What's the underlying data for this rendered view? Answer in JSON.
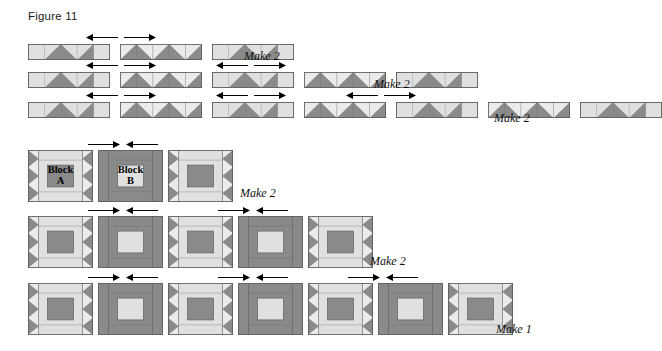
{
  "figure": {
    "title": "Figure 11",
    "title_x": 28,
    "title_y": 10
  },
  "colors": {
    "dark": "#8a8a8a",
    "dark_edge": "#6f6f6f",
    "light": "#e0e0e0",
    "light_alt": "#ebebeb",
    "outline": "#5f5f5f",
    "arrow": "#000000",
    "text": "#111111",
    "background": "#ffffff"
  },
  "legend": {
    "block_a_name": "Block",
    "block_a_sub": "A",
    "block_b_name": "Block",
    "block_b_sub": "B"
  },
  "strip_rows": [
    {
      "id": "strip-row-1",
      "x": 28,
      "y": 44,
      "segment_count": 3,
      "segments": [
        "light",
        "dark",
        "light"
      ],
      "make_label": "Make 2",
      "make_x": 244,
      "make_y": 49,
      "arrows": [
        {
          "dir": "left",
          "x": 86,
          "y": 33
        },
        {
          "dir": "right",
          "x": 124,
          "y": 33
        }
      ]
    },
    {
      "id": "strip-row-2",
      "x": 28,
      "y": 72,
      "segment_count": 5,
      "segments": [
        "light",
        "dark",
        "light",
        "dark",
        "light"
      ],
      "make_label": "Make 2",
      "make_x": 374,
      "make_y": 77,
      "arrows": [
        {
          "dir": "left",
          "x": 86,
          "y": 61
        },
        {
          "dir": "right",
          "x": 124,
          "y": 61
        },
        {
          "dir": "left",
          "x": 216,
          "y": 61
        },
        {
          "dir": "right",
          "x": 254,
          "y": 61
        }
      ]
    },
    {
      "id": "strip-row-3",
      "x": 28,
      "y": 102,
      "segment_count": 7,
      "segments": [
        "light",
        "dark",
        "light",
        "dark",
        "light",
        "dark",
        "light"
      ],
      "make_label": "Make 2",
      "make_x": 494,
      "make_y": 111,
      "arrows": [
        {
          "dir": "left",
          "x": 86,
          "y": 91
        },
        {
          "dir": "right",
          "x": 124,
          "y": 91
        },
        {
          "dir": "left",
          "x": 216,
          "y": 91
        },
        {
          "dir": "right",
          "x": 254,
          "y": 91
        },
        {
          "dir": "left",
          "x": 346,
          "y": 91
        },
        {
          "dir": "right",
          "x": 384,
          "y": 91
        }
      ]
    }
  ],
  "block_rows": [
    {
      "id": "block-row-1",
      "x": 28,
      "y": 150,
      "block_count": 3,
      "blocks": [
        "A",
        "B",
        "A"
      ],
      "labelled": true,
      "make_label": "Make 2",
      "make_x": 240,
      "make_y": 186,
      "arrows": [
        {
          "dir": "right",
          "x": 88,
          "y": 140
        },
        {
          "dir": "left",
          "x": 126,
          "y": 140
        }
      ]
    },
    {
      "id": "block-row-2",
      "x": 28,
      "y": 216,
      "block_count": 5,
      "blocks": [
        "A",
        "B",
        "A",
        "B",
        "A"
      ],
      "labelled": false,
      "make_label": "Make 2",
      "make_x": 370,
      "make_y": 254,
      "arrows": [
        {
          "dir": "right",
          "x": 88,
          "y": 206
        },
        {
          "dir": "left",
          "x": 126,
          "y": 206
        },
        {
          "dir": "right",
          "x": 218,
          "y": 206
        },
        {
          "dir": "left",
          "x": 256,
          "y": 206
        }
      ]
    },
    {
      "id": "block-row-3",
      "x": 28,
      "y": 283,
      "block_count": 7,
      "blocks": [
        "A",
        "B",
        "A",
        "B",
        "A",
        "B",
        "A"
      ],
      "labelled": false,
      "make_label": "Make 1",
      "make_x": 496,
      "make_y": 322,
      "arrows": [
        {
          "dir": "right",
          "x": 88,
          "y": 273
        },
        {
          "dir": "left",
          "x": 126,
          "y": 273
        },
        {
          "dir": "right",
          "x": 218,
          "y": 273
        },
        {
          "dir": "left",
          "x": 256,
          "y": 273
        },
        {
          "dir": "right",
          "x": 348,
          "y": 273
        },
        {
          "dir": "left",
          "x": 386,
          "y": 273
        }
      ]
    }
  ],
  "geometry": {
    "strip_seg_width": 82,
    "strip_seg_height": 16,
    "strip_gap": 10,
    "strip_units": 5,
    "block_width": 65,
    "block_height": 52,
    "block_gap": 5,
    "arrow_length": 32
  }
}
